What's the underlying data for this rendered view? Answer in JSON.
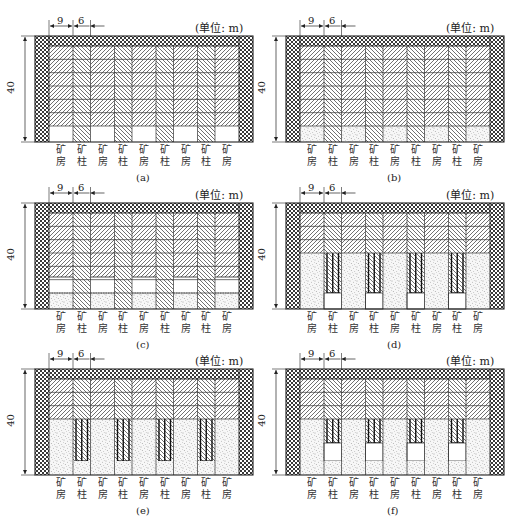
{
  "figure": {
    "unit_label": "(单位: m)",
    "dimensions": {
      "room_width": "9",
      "pillar_width": "6",
      "height": "40"
    },
    "column_labels": [
      {
        "top": "矿",
        "bottom": "房",
        "kind": "room"
      },
      {
        "top": "矿",
        "bottom": "柱",
        "kind": "pillar"
      },
      {
        "top": "矿",
        "bottom": "房",
        "kind": "room"
      },
      {
        "top": "矿",
        "bottom": "柱",
        "kind": "pillar"
      },
      {
        "top": "矿",
        "bottom": "房",
        "kind": "room"
      },
      {
        "top": "矿",
        "bottom": "柱",
        "kind": "pillar"
      },
      {
        "top": "矿",
        "bottom": "房",
        "kind": "room"
      },
      {
        "top": "矿",
        "bottom": "柱",
        "kind": "pillar"
      },
      {
        "top": "矿",
        "bottom": "房",
        "kind": "room"
      }
    ],
    "panels": [
      {
        "id": "a",
        "caption": "(a)",
        "stage": "rooms undercut at bottom, ore hatched",
        "ore_bands": 6,
        "fill": "none",
        "room_bottom": "empty"
      },
      {
        "id": "b",
        "caption": "(b)",
        "stage": "rooms bottom backfilled",
        "ore_bands": 6,
        "fill": "bottom-strip",
        "room_bottom": "filled"
      },
      {
        "id": "c",
        "caption": "(c)",
        "stage": "room slice mined above fill",
        "ore_bands": 6,
        "fill": "bottom-strip",
        "room_bottom": "empty-over-fill"
      },
      {
        "id": "d",
        "caption": "(d)",
        "stage": "rooms backfilled, pillars reinforced",
        "ore_bands": 3,
        "fill": "rooms-full",
        "pillar_bottom": "empty"
      },
      {
        "id": "e",
        "caption": "(e)",
        "stage": "pillar bottom backfilled",
        "ore_bands": 3,
        "fill": "rooms-full",
        "pillar_bottom": "filled"
      },
      {
        "id": "f",
        "caption": "(f)",
        "stage": "pillar slice mined above fill",
        "ore_bands": 3,
        "fill": "rooms-full",
        "pillar_bottom": "empty-over-fill"
      }
    ],
    "colors": {
      "line": "#222222",
      "crosshatch_fill": "#ffffff",
      "backfill_dot": "#555555"
    }
  }
}
